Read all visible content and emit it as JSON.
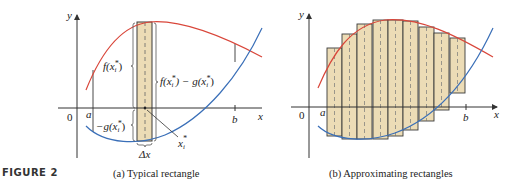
{
  "figure_label": "FIGURE 2",
  "colors": {
    "f_curve": "#d9463a",
    "g_curve": "#3a6fb8",
    "rect_fill": "#ecdcb6",
    "rect_stroke": "#3a3a3a",
    "axis": "#333333"
  },
  "panel_a": {
    "caption": "(a) Typical rectangle",
    "axis_x_label": "x",
    "axis_y_label": "y",
    "origin_label": "0",
    "a_label": "a",
    "b_label": "b",
    "f_label": "f(x",
    "f_label_sub": "i",
    "f_label_sup": "*",
    "diff_label": "f(x",
    "diff_label_mid": ") − g(x",
    "neg_g_label": "−g(x",
    "xi_label": "x",
    "xi_sub": "i",
    "xi_sup": "*",
    "dx_label": "Δx",
    "close_paren": ")"
  },
  "panel_b": {
    "caption": "(b) Approximating rectangles",
    "axis_x_label": "x",
    "axis_y_label": "y",
    "origin_label": "0",
    "a_label": "a",
    "b_label": "b",
    "rectangles": [
      {
        "x": 327,
        "top": 48,
        "bottom": 136
      },
      {
        "x": 342,
        "top": 34,
        "bottom": 139
      },
      {
        "x": 357,
        "top": 24,
        "bottom": 139
      },
      {
        "x": 373,
        "top": 20,
        "bottom": 139
      },
      {
        "x": 388,
        "top": 20,
        "bottom": 136
      },
      {
        "x": 403,
        "top": 21,
        "bottom": 130
      },
      {
        "x": 419,
        "top": 27,
        "bottom": 121
      },
      {
        "x": 434,
        "top": 33,
        "bottom": 110
      },
      {
        "x": 450,
        "top": 38,
        "bottom": 93
      }
    ],
    "rect_width": 15
  }
}
